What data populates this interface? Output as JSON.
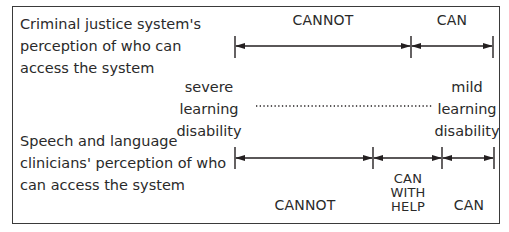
{
  "diagram": {
    "top_row": {
      "title_lines": [
        "Criminal justice system's",
        "perception of who can",
        "access the system"
      ],
      "segments": [
        {
          "label": "CANNOT",
          "from_x": 235,
          "to_x": 411
        },
        {
          "label": "CAN",
          "from_x": 411,
          "to_x": 493
        }
      ]
    },
    "scale": {
      "left_end_lines": [
        "severe",
        "learning",
        "disability"
      ],
      "right_end_lines": [
        "mild",
        "learning",
        "disability"
      ],
      "connector": "dotted"
    },
    "bottom_row": {
      "title_lines": [
        "Speech and language",
        "clinicians' perception of who",
        "can access the system"
      ],
      "segments": [
        {
          "label": "CANNOT",
          "from_x": 235,
          "to_x": 373
        },
        {
          "label_lines": [
            "CAN",
            "WITH",
            "HELP"
          ],
          "from_x": 373,
          "to_x": 442
        },
        {
          "label": "CAN",
          "from_x": 442,
          "to_x": 494
        }
      ]
    },
    "colors": {
      "line": "#231f20",
      "text": "#2a2a2a",
      "border": "#3a3a3a"
    }
  }
}
